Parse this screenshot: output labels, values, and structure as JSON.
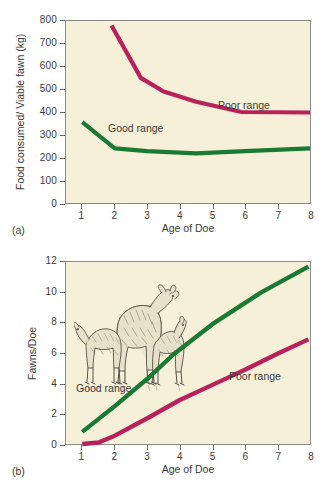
{
  "figure": {
    "background": "#ffffff",
    "plot_background": "#f6f0d9",
    "colors": {
      "good_range": "#1a7a33",
      "poor_range": "#b9215a",
      "axis": "#6d6d68",
      "text": "#3a3a38"
    }
  },
  "panel_a": {
    "label": "(a)",
    "ylabel": "Food consumed/ Viable fawn (kg)",
    "xlabel": "Age of Doe",
    "yticks": [
      "0",
      "100",
      "200",
      "300",
      "400",
      "500",
      "600",
      "700",
      "800"
    ],
    "xticks": [
      "1",
      "2",
      "3",
      "4",
      "5",
      "6",
      "7",
      "8"
    ],
    "series_labels": {
      "good": "Good range",
      "poor": "Poor range"
    }
  },
  "panel_b": {
    "label": "(b)",
    "ylabel": "Fawns/Doe",
    "xlabel": "Age of Doe",
    "yticks": [
      "0",
      "2",
      "4",
      "6",
      "8",
      "10",
      "12"
    ],
    "xticks": [
      "1",
      "2",
      "3",
      "4",
      "5",
      "6",
      "7",
      "8"
    ],
    "series_labels": {
      "good": "Good range",
      "poor": "Poor range"
    },
    "illustration": "doe-with-two-fawns-drawing"
  },
  "chart_data": [
    {
      "type": "line",
      "title": "",
      "panel": "(a)",
      "xlabel": "Age of Doe",
      "ylabel": "Food consumed/ Viable fawn (kg)",
      "xlim": [
        0.5,
        8
      ],
      "ylim": [
        0,
        800
      ],
      "xticks": [
        1,
        2,
        3,
        4,
        5,
        6,
        7,
        8
      ],
      "yticks": [
        0,
        100,
        200,
        300,
        400,
        500,
        600,
        700,
        800
      ],
      "grid": false,
      "legend": "inline-annotations",
      "series": [
        {
          "name": "Poor range",
          "color": "#b9215a",
          "x": [
            1.9,
            2.8,
            3.5,
            4.5,
            5.9,
            8
          ],
          "values": [
            780,
            550,
            490,
            445,
            400,
            398
          ]
        },
        {
          "name": "Good range",
          "color": "#1a7a33",
          "x": [
            1,
            2,
            3,
            4.5,
            6,
            8
          ],
          "values": [
            355,
            240,
            228,
            218,
            228,
            240
          ]
        }
      ]
    },
    {
      "type": "line",
      "title": "",
      "panel": "(b)",
      "xlabel": "Age of Doe",
      "ylabel": "Fawns/Doe",
      "xlim": [
        0.5,
        8
      ],
      "ylim": [
        0,
        12
      ],
      "xticks": [
        1,
        2,
        3,
        4,
        5,
        6,
        7,
        8
      ],
      "yticks": [
        0,
        2,
        4,
        6,
        8,
        10,
        12
      ],
      "grid": false,
      "legend": "inline-annotations",
      "series": [
        {
          "name": "Good range",
          "color": "#1a7a33",
          "x": [
            1,
            2,
            3,
            3.8,
            5,
            6.5,
            7.95
          ],
          "values": [
            0.8,
            2.5,
            4.3,
            5.9,
            7.9,
            10.0,
            11.7
          ]
        },
        {
          "name": "Poor range",
          "color": "#b9215a",
          "x": [
            1,
            1.5,
            2,
            3,
            4,
            5,
            6,
            7,
            7.95
          ],
          "values": [
            0.0,
            0.1,
            0.55,
            1.7,
            2.9,
            3.9,
            4.9,
            5.95,
            6.9
          ]
        }
      ]
    }
  ]
}
